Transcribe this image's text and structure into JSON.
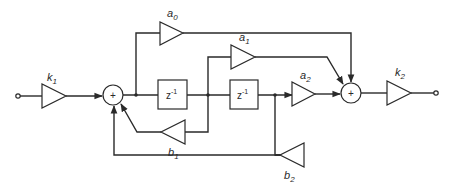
{
  "diagram": {
    "type": "second-order IIR digital filter (biquad) block diagram",
    "input_terminal": "input",
    "output_terminal": "output",
    "gains": {
      "k1": {
        "symbol": "k",
        "sub": "1"
      },
      "k2": {
        "symbol": "k",
        "sub": "2"
      },
      "a0": {
        "symbol": "a",
        "sub": "0"
      },
      "a1": {
        "symbol": "a",
        "sub": "1"
      },
      "a2": {
        "symbol": "a",
        "sub": "2"
      },
      "b1": {
        "symbol": "b",
        "sub": "1"
      },
      "b2": {
        "symbol": "b",
        "sub": "2"
      }
    },
    "delays": [
      {
        "base": "z",
        "exp": "-1"
      },
      {
        "base": "z",
        "exp": "-1"
      }
    ],
    "adders": [
      {
        "symbol": "+"
      },
      {
        "symbol": "+"
      }
    ],
    "colors": {
      "line": "#2a2a2a",
      "background": "#ffffff"
    },
    "connections": [
      "input -> k1 -> adder1",
      "adder1 -> z^-1 (1) -> z^-1 (2)",
      "adder1 output -> a0 -> adder2",
      "z^-1 (1) output -> a1 -> adder2",
      "z^-1 (2) output -> a2 -> adder2",
      "z^-1 (1) output -> b1 -> adder1",
      "z^-1 (2) output -> b2 -> adder1",
      "adder2 -> k2 -> output"
    ]
  }
}
